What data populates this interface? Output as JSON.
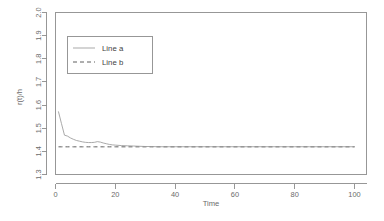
{
  "chart_data": {
    "type": "line",
    "title": "",
    "subtitle": "",
    "xlabel": "Time",
    "ylabel": "r(t)/h",
    "xlim": [
      0,
      104
    ],
    "ylim": [
      1.3,
      2.0
    ],
    "grid": false,
    "legend_position": "top-left",
    "xticks": [
      "0",
      "20",
      "40",
      "60",
      "80",
      "100"
    ],
    "xtick_values": [
      0,
      20,
      40,
      60,
      80,
      100
    ],
    "yticks": [
      "1.3",
      "1.4",
      "1.5",
      "1.6",
      "1.7",
      "1.8",
      "1.9",
      "2.0"
    ],
    "ytick_values": [
      1.3,
      1.4,
      1.5,
      1.6,
      1.7,
      1.8,
      1.9,
      2.0
    ],
    "x": [
      1,
      2,
      3,
      4,
      5,
      6,
      7,
      8,
      9,
      10,
      11,
      12,
      13,
      14,
      15,
      16,
      17,
      18,
      19,
      20,
      22,
      24,
      26,
      28,
      30,
      32,
      34,
      36,
      38,
      40,
      45,
      50,
      55,
      60,
      65,
      70,
      75,
      80,
      85,
      90,
      95,
      100
    ],
    "series": [
      {
        "name": "Line a",
        "style": "solid",
        "color": "#9a9a9a",
        "values": [
          1.571,
          1.52,
          1.47,
          1.466,
          1.458,
          1.452,
          1.447,
          1.444,
          1.441,
          1.439,
          1.438,
          1.438,
          1.439,
          1.442,
          1.44,
          1.436,
          1.433,
          1.43,
          1.428,
          1.427,
          1.425,
          1.424,
          1.423,
          1.422,
          1.421,
          1.421,
          1.42,
          1.42,
          1.42,
          1.42,
          1.42,
          1.42,
          1.42,
          1.42,
          1.42,
          1.42,
          1.42,
          1.42,
          1.42,
          1.42,
          1.42,
          1.42
        ]
      },
      {
        "name": "Line b",
        "style": "dashed",
        "color": "#5e5e5e",
        "constant": 1.4195,
        "values": [
          1.4195,
          1.4195,
          1.4195,
          1.4195,
          1.4195,
          1.4195,
          1.4195,
          1.4195,
          1.4195,
          1.4195,
          1.4195,
          1.4195,
          1.4195,
          1.4195,
          1.4195,
          1.4195,
          1.4195,
          1.4195,
          1.4195,
          1.4195,
          1.4195,
          1.4195,
          1.4195,
          1.4195,
          1.4195,
          1.4195,
          1.4195,
          1.4195,
          1.4195,
          1.4195,
          1.4195,
          1.4195,
          1.4195,
          1.4195,
          1.4195,
          1.4195,
          1.4195,
          1.4195,
          1.4195,
          1.4195,
          1.4195,
          1.4195
        ]
      }
    ],
    "legend": [
      {
        "label": "Line a",
        "style": "solid",
        "color": "#9a9a9a"
      },
      {
        "label": "Line b",
        "style": "dashed",
        "color": "#5e5e5e"
      }
    ]
  },
  "axis": {
    "x_title": "Time",
    "y_title": "r(t)/h"
  }
}
